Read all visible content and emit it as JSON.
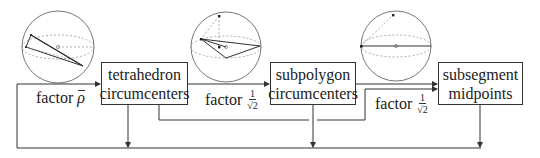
{
  "diagram": {
    "nodes": [
      {
        "id": "tetra",
        "line1": "tetrahedron",
        "line2": "circumcenters"
      },
      {
        "id": "subpoly",
        "line1": "subpolygon",
        "line2": "circumcenters"
      },
      {
        "id": "subseg",
        "line1": "subsegment",
        "line2": "midpoints"
      }
    ],
    "edge_labels": {
      "feedback": {
        "word": "factor",
        "symbol": "ρ"
      },
      "tetra_to_subpoly": {
        "word": "factor",
        "num": "1",
        "den": "√2"
      },
      "subpoly_to_subseg": {
        "word": "factor",
        "num": "1",
        "den": "√2"
      }
    },
    "spheres": [
      {
        "id": "sphere-tetrahedron",
        "caption": ""
      },
      {
        "id": "sphere-subpolygon",
        "caption": ""
      },
      {
        "id": "sphere-subsegment",
        "caption": ""
      }
    ],
    "colors": {
      "line": "#333333",
      "dashed": "#888888",
      "background": "#ffffff"
    }
  }
}
